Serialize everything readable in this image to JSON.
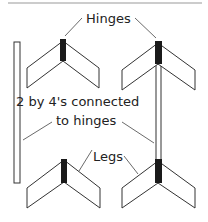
{
  "diagram": {
    "labels": {
      "hinges": "Hinges",
      "two_by_fours_line1": "2 by 4's connected",
      "two_by_fours_line2": "to hinges",
      "legs": "Legs"
    },
    "colors": {
      "background": "#ffffff",
      "outline": "#333333",
      "hinge": "#1a1a1a",
      "top_rule": "#999999"
    },
    "components": [
      "top-left-leg-assembly",
      "top-right-leg-assembly",
      "bottom-left-leg-assembly",
      "bottom-right-leg-assembly",
      "loose-2x4-post",
      "connected-2x4-post"
    ]
  }
}
